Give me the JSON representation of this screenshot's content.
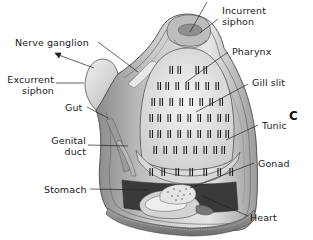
{
  "figure": {
    "panel_letter": "C",
    "labels": {
      "incurrent_siphon": "Incurrent\nsiphon",
      "nerve_ganglion": "Nerve ganglion",
      "pharynx": "Pharynx",
      "excurrent_siphon": "Excurrent\nsiphon",
      "gill_slit": "Gill slit",
      "gut": "Gut",
      "genital_duct": "Genital\nduct",
      "tunic": "Tunic",
      "gonad": "Gonad",
      "stomach": "Stomach",
      "heart": "Heart"
    }
  }
}
